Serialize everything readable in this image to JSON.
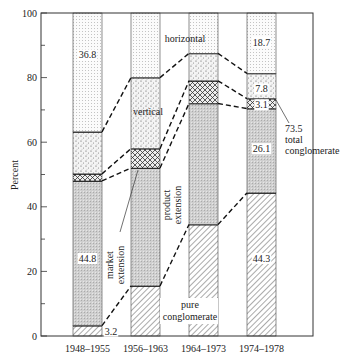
{
  "chart_data": {
    "type": "bar",
    "stacked": true,
    "title": "",
    "xlabel": "",
    "ylabel": "Percent",
    "ylim": [
      0,
      100
    ],
    "yticks": [
      0,
      20,
      40,
      60,
      80,
      100
    ],
    "grid": false,
    "categories": [
      "1948–1955",
      "1956–1963",
      "1964–1973",
      "1974–1978"
    ],
    "series": [
      {
        "name": "pure conglomerate",
        "values": [
          3.2,
          15.5,
          34.5,
          44.3
        ],
        "pattern": "diagonal-hatch"
      },
      {
        "name": "product extension",
        "values": [
          44.8,
          36.5,
          37.5,
          26.1
        ],
        "pattern": "fine-grey"
      },
      {
        "name": "market extension",
        "values": [
          2.2,
          6.0,
          7.0,
          3.1
        ],
        "pattern": "crosshatch"
      },
      {
        "name": "vertical",
        "values": [
          13.0,
          22.0,
          8.5,
          7.8
        ],
        "pattern": "coarse-stipple"
      },
      {
        "name": "horizontal",
        "values": [
          36.8,
          20.0,
          12.5,
          18.7
        ],
        "pattern": "fine-dots"
      }
    ],
    "data_labels": [
      {
        "text": "36.8",
        "category": "1948–1955",
        "series": "horizontal"
      },
      {
        "text": "44.8",
        "category": "1948–1955",
        "series": "product extension"
      },
      {
        "text": "3.2",
        "category": "1948–1955",
        "series": "pure conglomerate"
      },
      {
        "text": "18.7",
        "category": "1974–1978",
        "series": "horizontal"
      },
      {
        "text": "7.8",
        "category": "1974–1978",
        "series": "vertical"
      },
      {
        "text": "3.1",
        "category": "1974–1978",
        "series": "market extension"
      },
      {
        "text": "26.1",
        "category": "1974–1978",
        "series": "product extension"
      },
      {
        "text": "44.3",
        "category": "1974–1978",
        "series": "pure conglomerate"
      }
    ],
    "annotations": [
      {
        "text": "horizontal"
      },
      {
        "text": "vertical"
      },
      {
        "text": "market extension"
      },
      {
        "text": "product extension"
      },
      {
        "text": "pure conglomerate"
      },
      {
        "text": "73.5 total conglomerate"
      }
    ],
    "connectors": "dashed lines join series boundaries between adjacent bars"
  },
  "labels": {
    "ylabel": "Percent",
    "horizontal": "horizontal",
    "vertical": "vertical",
    "market_1": "market",
    "market_2": "extension",
    "product_1": "product",
    "product_2": "extension",
    "pure_1": "pure",
    "pure_2": "conglomerate",
    "total_1": "73.5",
    "total_2": "total",
    "total_3": "conglomerate"
  }
}
